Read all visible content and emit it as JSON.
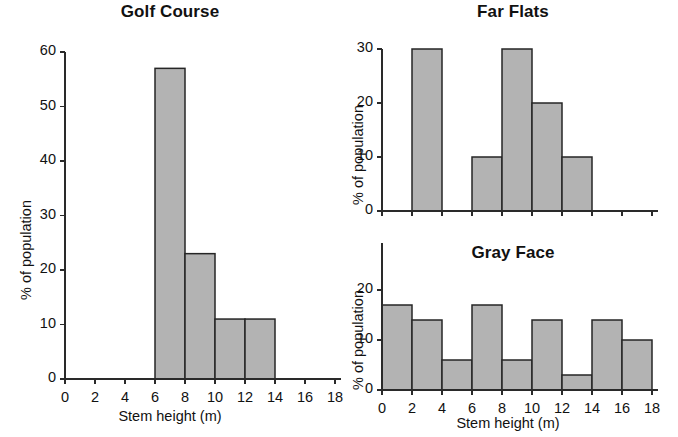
{
  "figure": {
    "background_color": "#ffffff",
    "bar_fill_color": "#b3b3b3",
    "bar_edge_color": "#262626",
    "axis_color": "#2a2a2a"
  },
  "panels": {
    "golf_course": {
      "title": "Golf Course",
      "xlabel": "Stem height (m)",
      "ylabel": "% of population",
      "xticks": [
        "0",
        "2",
        "4",
        "6",
        "8",
        "10",
        "12",
        "14",
        "16",
        "18"
      ],
      "yticks": [
        "0",
        "10",
        "20",
        "30",
        "40",
        "50",
        "60"
      ]
    },
    "far_flats": {
      "title": "Far Flats",
      "xlabel": "",
      "ylabel": "% of population",
      "xticks": [
        "",
        "",
        "",
        "",
        "",
        "",
        "",
        "",
        "",
        ""
      ],
      "yticks": [
        "0",
        "10",
        "20",
        "30"
      ]
    },
    "gray_face": {
      "title": "Gray Face",
      "xlabel": "Stem height (m)",
      "ylabel": "% of population",
      "xticks": [
        "0",
        "2",
        "4",
        "6",
        "8",
        "10",
        "12",
        "14",
        "16",
        "18"
      ],
      "yticks": [
        "0",
        "10",
        "20"
      ]
    }
  },
  "chart_data": [
    {
      "type": "bar",
      "title": "Golf Course",
      "xlabel": "Stem height (m)",
      "ylabel": "% of population",
      "xlim": [
        0,
        18
      ],
      "ylim": [
        0,
        60
      ],
      "ytick_values": [
        0,
        10,
        20,
        30,
        40,
        50,
        60
      ],
      "xtick_values": [
        0,
        2,
        4,
        6,
        8,
        10,
        12,
        14,
        16,
        18
      ],
      "grid": false,
      "legend": "none",
      "bin_width": 2,
      "categories": [
        "0-2",
        "2-4",
        "4-6",
        "6-8",
        "8-10",
        "10-12",
        "12-14",
        "14-16",
        "16-18"
      ],
      "bin_starts": [
        0,
        2,
        4,
        6,
        8,
        10,
        12,
        14,
        16
      ],
      "values": [
        0,
        0,
        0,
        57,
        23,
        11,
        11,
        0,
        0
      ]
    },
    {
      "type": "bar",
      "title": "Far Flats",
      "xlabel": "Stem height (m)",
      "ylabel": "% of population",
      "xlim": [
        0,
        18
      ],
      "ylim": [
        0,
        30
      ],
      "ytick_values": [
        0,
        10,
        20,
        30
      ],
      "xtick_values": [
        0,
        2,
        4,
        6,
        8,
        10,
        12,
        14,
        16,
        18
      ],
      "grid": false,
      "legend": "none",
      "bin_width": 2,
      "categories": [
        "0-2",
        "2-4",
        "4-6",
        "6-8",
        "8-10",
        "10-12",
        "12-14",
        "14-16",
        "16-18"
      ],
      "bin_starts": [
        0,
        2,
        4,
        6,
        8,
        10,
        12,
        14,
        16
      ],
      "values": [
        0,
        30,
        0,
        10,
        30,
        20,
        10,
        0,
        0
      ]
    },
    {
      "type": "bar",
      "title": "Gray Face",
      "xlabel": "Stem height (m)",
      "ylabel": "% of population",
      "xlim": [
        0,
        18
      ],
      "ylim": [
        0,
        25
      ],
      "ytick_values": [
        0,
        10,
        20
      ],
      "xtick_values": [
        0,
        2,
        4,
        6,
        8,
        10,
        12,
        14,
        16,
        18
      ],
      "grid": false,
      "legend": "none",
      "bin_width": 2,
      "categories": [
        "0-2",
        "2-4",
        "4-6",
        "6-8",
        "8-10",
        "10-12",
        "12-14",
        "14-16",
        "16-18"
      ],
      "bin_starts": [
        0,
        2,
        4,
        6,
        8,
        10,
        12,
        14,
        16
      ],
      "values": [
        17,
        14,
        6,
        17,
        6,
        14,
        3,
        14,
        10
      ]
    }
  ]
}
